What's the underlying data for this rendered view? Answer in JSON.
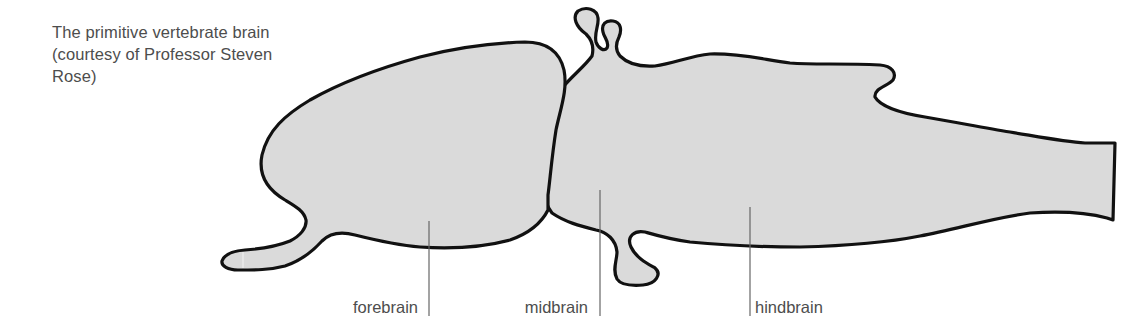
{
  "caption": {
    "lines": [
      "The primitive vertebrate brain",
      "(courtesy of Professor Steven",
      "Rose)"
    ]
  },
  "labels": {
    "forebrain": "forebrain",
    "midbrain": "midbrain",
    "hindbrain": "hindbrain"
  },
  "colors": {
    "fill": "#dadada",
    "outline": "#111111",
    "leader": "#666666",
    "text": "#4d4d4d"
  }
}
